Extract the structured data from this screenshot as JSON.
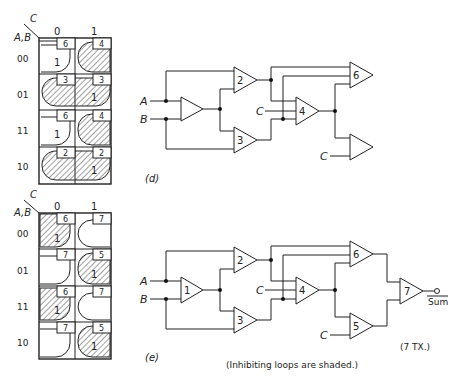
{
  "figure": {
    "panels": [
      {
        "id": "d",
        "label": "(d)",
        "kmap": {
          "col_var": "C",
          "row_var": "A,B",
          "col_headers": [
            "0",
            "1"
          ],
          "row_headers": [
            "00",
            "01",
            "11",
            "10"
          ],
          "cells": [
            [
              {
                "gate": "6",
                "value": "1",
                "shaded": false
              },
              {
                "gate": "4",
                "value": "",
                "shaded": true
              }
            ],
            [
              {
                "gate": "3",
                "value": "",
                "shaded": true
              },
              {
                "gate": "3",
                "value": "1",
                "shaded": true
              }
            ],
            [
              {
                "gate": "6",
                "value": "1",
                "shaded": false
              },
              {
                "gate": "4",
                "value": "",
                "shaded": true
              }
            ],
            [
              {
                "gate": "2",
                "value": "",
                "shaded": true
              },
              {
                "gate": "2",
                "value": "1",
                "shaded": true
              }
            ]
          ]
        },
        "circuit": {
          "inputs": [
            "A",
            "B",
            "C",
            "C"
          ],
          "gates": [
            "",
            "2",
            "3",
            "4",
            "6",
            ""
          ]
        }
      },
      {
        "id": "e",
        "label": "(e)",
        "kmap": {
          "col_var": "C",
          "row_var": "A,B",
          "col_headers": [
            "0",
            "1"
          ],
          "row_headers": [
            "00",
            "01",
            "11",
            "10"
          ],
          "cells": [
            [
              {
                "gate": "6",
                "value": "1",
                "shaded": true
              },
              {
                "gate": "7",
                "value": "",
                "shaded": false
              }
            ],
            [
              {
                "gate": "7",
                "value": "",
                "shaded": false
              },
              {
                "gate": "5",
                "value": "1",
                "shaded": true
              }
            ],
            [
              {
                "gate": "6",
                "value": "1",
                "shaded": true
              },
              {
                "gate": "7",
                "value": "",
                "shaded": false
              }
            ],
            [
              {
                "gate": "7",
                "value": "",
                "shaded": false
              },
              {
                "gate": "5",
                "value": "1",
                "shaded": true
              }
            ]
          ]
        },
        "circuit": {
          "inputs": [
            "A",
            "B",
            "C",
            "C"
          ],
          "gates": [
            "1",
            "2",
            "3",
            "4",
            "6",
            "5",
            "7"
          ],
          "output": "Sum",
          "transistor_count": "(7 TX.)"
        }
      }
    ],
    "note": "(Inhibiting loops are shaded.)"
  }
}
